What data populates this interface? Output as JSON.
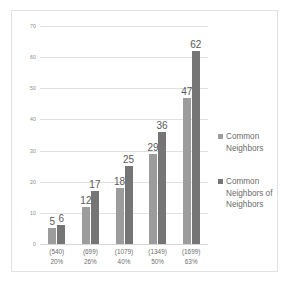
{
  "chart_data": {
    "type": "bar",
    "title": "",
    "xlabel": "",
    "ylabel": "",
    "ylim": [
      0,
      70
    ],
    "yticks": [
      0,
      10,
      20,
      30,
      40,
      50,
      60,
      70
    ],
    "grid": true,
    "legend_position": "right",
    "categories": [
      {
        "line1": "(540)",
        "line2": "20%"
      },
      {
        "line1": "(699)",
        "line2": "26%"
      },
      {
        "line1": "(1079)",
        "line2": "40%"
      },
      {
        "line1": "(1349)",
        "line2": "50%"
      },
      {
        "line1": "(1699)",
        "line2": "63%"
      }
    ],
    "category_labels": [
      "(540) 20%",
      "(699) 26%",
      "(1079) 40%",
      "(1349) 50%",
      "(1699) 63%"
    ],
    "series": [
      {
        "name": "Common Neighbors",
        "color": "#9c9c9c",
        "values": [
          5,
          12,
          18,
          29,
          47
        ]
      },
      {
        "name": "Common Neighbors of Neighbors",
        "color": "#757575",
        "values": [
          6,
          17,
          25,
          36,
          62
        ]
      }
    ]
  },
  "legend": {
    "entries": [
      {
        "label": "Common Neighbors",
        "color": "#9c9c9c"
      },
      {
        "label": "Common Neighbors of Neighbors",
        "color": "#757575"
      }
    ]
  }
}
